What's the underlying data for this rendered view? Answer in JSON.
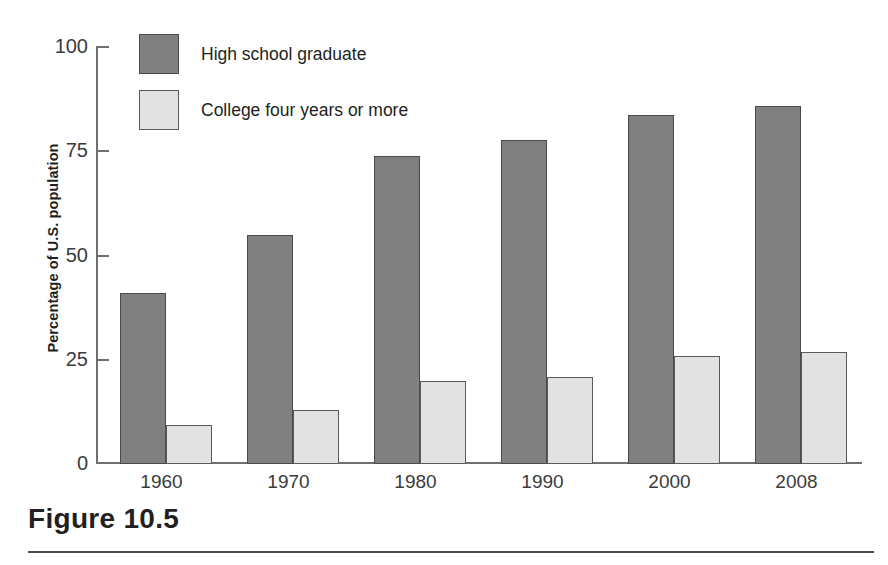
{
  "figure": {
    "caption_label": "Figure 10.5"
  },
  "chart_data": {
    "type": "bar",
    "title": "",
    "subtitle": "",
    "xlabel": "",
    "ylabel": "Percentage of U.S. population",
    "categories": [
      "1960",
      "1970",
      "1980",
      "1990",
      "2000",
      "2008"
    ],
    "series": [
      {
        "name": "High school graduate",
        "color": "#808080",
        "values": [
          41,
          55,
          74,
          78,
          84,
          86
        ]
      },
      {
        "name": "College four years or more",
        "color": "#e2e2e2",
        "values": [
          9.5,
          13,
          20,
          21,
          26,
          27
        ]
      }
    ],
    "ylim": [
      0,
      100
    ],
    "yticks": [
      "0",
      "25",
      "50",
      "75",
      "100"
    ],
    "ytick_values": [
      0,
      25,
      50,
      75,
      100
    ],
    "grid": false,
    "legend_position": "top-left",
    "bar_border_color": "#4b4b4b",
    "axis_color": "#6f6f6f"
  }
}
